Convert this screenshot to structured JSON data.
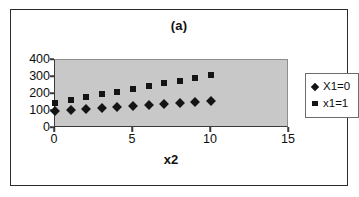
{
  "chart_data": {
    "type": "scatter",
    "title": "(a)",
    "xlabel": "x2",
    "ylabel": "",
    "xlim": [
      0,
      15
    ],
    "ylim": [
      0,
      400
    ],
    "xticks": [
      0,
      5,
      10,
      15
    ],
    "yticks": [
      0,
      100,
      200,
      300,
      400
    ],
    "grid": false,
    "legend_position": "right",
    "plot_background": "#c8c8c8",
    "marker_color": "#141414",
    "x": [
      0,
      1,
      2,
      3,
      4,
      5,
      6,
      7,
      8,
      9,
      10
    ],
    "series": [
      {
        "name": "X1=0",
        "marker": "diamond",
        "values": [
          100,
          106,
          112,
          118,
          124,
          130,
          136,
          142,
          148,
          154,
          160
        ]
      },
      {
        "name": "x1=1",
        "marker": "square",
        "values": [
          150,
          166,
          182,
          198,
          214,
          230,
          246,
          262,
          278,
          294,
          310
        ]
      }
    ]
  },
  "figure": {
    "title": "(a)",
    "axis_title_x": "x2"
  }
}
